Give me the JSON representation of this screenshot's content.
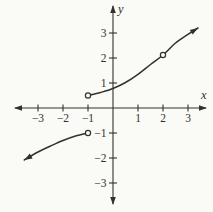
{
  "figure": {
    "background": "#fafaf7",
    "ink": "#32312e",
    "axis_labels": {
      "x": "x",
      "y": "y"
    }
  },
  "chart_data": {
    "type": "line",
    "title": "",
    "xlabel": "x",
    "ylabel": "y",
    "xlim": [
      -3.8,
      3.8
    ],
    "ylim": [
      -4.1,
      3.4
    ],
    "grid": false,
    "legend": false,
    "x_ticks": [
      {
        "value": -3,
        "label": "−3"
      },
      {
        "value": -2,
        "label": "−2"
      },
      {
        "value": -1,
        "label": "−1"
      },
      {
        "value": 1,
        "label": "1"
      },
      {
        "value": 2,
        "label": "2"
      },
      {
        "value": 3,
        "label": "3"
      }
    ],
    "y_ticks": [
      {
        "value": 3,
        "label": "3"
      },
      {
        "value": 2,
        "label": "2"
      },
      {
        "value": 1,
        "label": "1"
      },
      {
        "value": -1,
        "label": "−1"
      },
      {
        "value": -2,
        "label": "−2"
      },
      {
        "value": -3,
        "label": "−3"
      }
    ],
    "series": [
      {
        "name": "left-branch",
        "points": [
          [
            -3.55,
            -2.08
          ],
          [
            -3,
            -1.76
          ],
          [
            -2.5,
            -1.52
          ],
          [
            -2,
            -1.3
          ],
          [
            -1.5,
            -1.12
          ],
          [
            -1,
            -1
          ]
        ],
        "start_arrow": true,
        "end_arrow": false,
        "start_open_point": false,
        "end_open_point": true,
        "holes": []
      },
      {
        "name": "right-branch",
        "points": [
          [
            -1,
            0.5
          ],
          [
            -0.5,
            0.62
          ],
          [
            0,
            0.78
          ],
          [
            0.5,
            1.02
          ],
          [
            1,
            1.35
          ],
          [
            1.5,
            1.74
          ],
          [
            2,
            2.12
          ],
          [
            2.5,
            2.6
          ],
          [
            3,
            2.95
          ],
          [
            3.4,
            3.2
          ]
        ],
        "start_arrow": false,
        "end_arrow": true,
        "start_open_point": true,
        "end_open_point": false,
        "holes": [
          [
            2,
            2.12
          ]
        ]
      }
    ]
  }
}
